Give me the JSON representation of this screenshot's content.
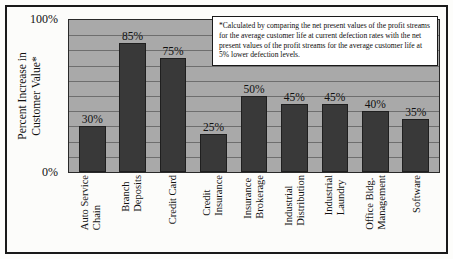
{
  "chart_data": {
    "type": "bar",
    "title": "",
    "xlabel": "",
    "ylabel": "Percent Increase in Customer Value*",
    "ylabel_line1": "Percent Increase in",
    "ylabel_line2": "Customer Value*",
    "ylim": [
      0,
      100
    ],
    "ytick_labels": [
      "100%",
      "0%"
    ],
    "ytick_values": [
      100,
      0
    ],
    "grid": true,
    "grid_interval": 10,
    "legend": "none",
    "categories": [
      "Auto Service Chain",
      "Branch Deposits",
      "Credit Card",
      "Credit Insurance",
      "Insurance Brokerage",
      "Industrial Distribution",
      "Industrial Laundry",
      "Office Bldg. Management",
      "Software"
    ],
    "category_lines": [
      [
        "Auto Service",
        "Chain"
      ],
      [
        "Branch",
        "Deposits"
      ],
      [
        "Credit Card",
        ""
      ],
      [
        "Credit",
        "Insurance"
      ],
      [
        "Insurance",
        "Brokerage"
      ],
      [
        "Industrial",
        "Distribution"
      ],
      [
        "Industrial",
        "Laundry"
      ],
      [
        "Office Bldg.",
        "Management"
      ],
      [
        "Software",
        ""
      ]
    ],
    "values": [
      30,
      85,
      75,
      25,
      50,
      45,
      45,
      40,
      35
    ],
    "value_labels": [
      "30%",
      "85%",
      "75%",
      "25%",
      "50%",
      "45%",
      "45%",
      "40%",
      "35%"
    ],
    "annotation": "*Calculated by comparing the net present values of the profit streams for the average customer life at current defection rates with the net present values of the profit streams for the average customer life at 5% lower defection levels.",
    "colors": {
      "bar_fill": "#393939",
      "bar_edge": "#1f1f1f",
      "plot_background": "#a9a9a9",
      "gridline": "#6e6e6e",
      "frame_border": "#1a1a1a",
      "figure_background": "#fcfcfa",
      "text": "#111111",
      "annotation_background": "#ffffff"
    }
  }
}
